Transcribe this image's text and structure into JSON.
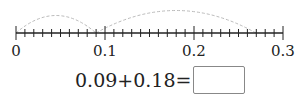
{
  "number_line": {
    "min": 0,
    "max": 0.3,
    "minor_step": 0.01,
    "major_step": 0.1,
    "labels": [
      "0",
      "0.1",
      "0.2",
      "0.3"
    ],
    "jumps": [
      {
        "from": 0,
        "to": 0.09
      },
      {
        "from": 0.09,
        "to": 0.27
      }
    ]
  },
  "equation": {
    "text": "0.09+0.18=",
    "answer": ""
  }
}
